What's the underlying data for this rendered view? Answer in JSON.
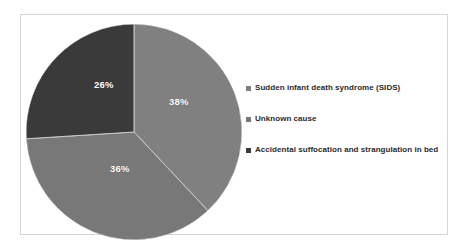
{
  "chart_data": {
    "type": "pie",
    "title": "",
    "subtitle": "",
    "xlabel": "",
    "ylabel": "",
    "grid": false,
    "legend_position": "right",
    "start_angle_deg": 0,
    "direction": "clockwise",
    "categories": [
      "Sudden infant death syndrome (SIDS)",
      "Unknown cause",
      "Accidental suffocation and strangulation in bed"
    ],
    "values": [
      38,
      36,
      26
    ],
    "value_unit": "%",
    "data_labels": [
      "38%",
      "36%",
      "26%"
    ],
    "colors": [
      "#808080",
      "#787878",
      "#3a3a3a"
    ],
    "slices": [
      {
        "label": "Sudden infant death syndrome (SIDS)",
        "value": 38,
        "display": "38%",
        "color": "#808080"
      },
      {
        "label": "Unknown cause",
        "value": 36,
        "display": "36%",
        "color": "#787878"
      },
      {
        "label": "Accidental suffocation and strangulation in bed",
        "value": 26,
        "display": "26%",
        "color": "#3a3a3a"
      }
    ]
  },
  "legend": {
    "items": [
      {
        "label": "Sudden infant death syndrome (SIDS)",
        "color": "#808080"
      },
      {
        "label": "Unknown cause",
        "color": "#787878"
      },
      {
        "label": "Accidental suffocation and strangulation in bed",
        "color": "#3a3a3a"
      }
    ]
  },
  "style": {
    "frame_border": "#d6d6d6",
    "background": "#ffffff",
    "slice_divider": "#c9c9c9",
    "label_color": "#ffffff",
    "legend_text_color": "#2b2b2b"
  }
}
